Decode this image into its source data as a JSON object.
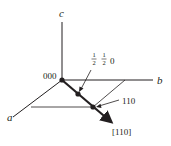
{
  "diagram": {
    "type": "crystallographic-direction",
    "axes": {
      "a": {
        "label": "a"
      },
      "b": {
        "label": "b"
      },
      "c": {
        "label": "c"
      }
    },
    "points": {
      "origin": {
        "label": "000"
      },
      "half": {
        "num1": "1",
        "den1": "2",
        "num2": "1",
        "den2": "2",
        "tail": "0"
      },
      "end": {
        "label": "110"
      }
    },
    "direction": {
      "label": "[110]"
    },
    "colors": {
      "line": "#231f20",
      "background": "#ffffff"
    }
  }
}
